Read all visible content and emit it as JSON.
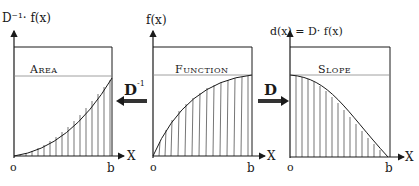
{
  "panels": [
    {
      "id": "area",
      "y_label": "D⁻¹· f(x)",
      "title": "Area",
      "x_label": "X",
      "origin_label": "o",
      "end_label": "b"
    },
    {
      "id": "function",
      "y_label": "f(x)",
      "title": "Function",
      "x_label": "X",
      "origin_label": "o",
      "end_label": "b"
    },
    {
      "id": "slope",
      "y_label": "d(x) = D· f(x)",
      "title": "Slope",
      "x_label": "X",
      "origin_label": "o",
      "end_label": "b"
    }
  ],
  "operators": {
    "inverse": {
      "label": "D",
      "superscript": "-1",
      "direction": "left"
    },
    "derivative": {
      "label": "D",
      "direction": "right"
    }
  },
  "colors": {
    "ink": "#1a1a1a",
    "paper": "#ffffff",
    "guide": "#888888"
  }
}
